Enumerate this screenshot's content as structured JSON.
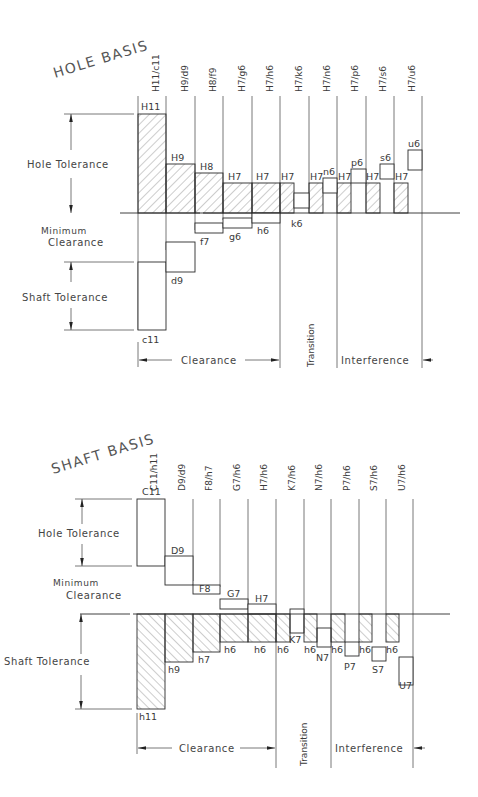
{
  "top": {
    "title": "HOLE BASIS",
    "fits": [
      "H11/c11",
      "H9/d9",
      "H8/f9",
      "H7/g6",
      "H7/h6",
      "H7/k6",
      "H7/n6",
      "H7/p6",
      "H7/s6",
      "H7/u6"
    ],
    "hole_labels": [
      "H11",
      "H9",
      "H8",
      "H7",
      "H7",
      "H7",
      "H7",
      "H7",
      "H7",
      "H7"
    ],
    "shaft_labels": [
      "c11",
      "d9",
      "f7",
      "g6",
      "h6",
      "k6",
      "n6",
      "p6",
      "s6",
      "u6"
    ],
    "side_labels": {
      "hole_tolerance": "Hole Tolerance",
      "minimum": "Minimum",
      "clearance": "Clearance",
      "shaft_tolerance": "Shaft Tolerance"
    },
    "zones": {
      "clearance": "Clearance",
      "transition": "Transition",
      "interference": "Interference"
    }
  },
  "bottom": {
    "title": "SHAFT BASIS",
    "fits": [
      "C11/h11",
      "D9/d9",
      "F8/h7",
      "G7/h6",
      "H7/h6",
      "K7/h6",
      "N7/h6",
      "P7/h6",
      "S7/h6",
      "U7/h6"
    ],
    "hole_labels": [
      "C11",
      "D9",
      "F8",
      "G7",
      "H7",
      "K7",
      "N7",
      "P7",
      "S7",
      "U7"
    ],
    "shaft_labels": [
      "h11",
      "h9",
      "h7",
      "h6",
      "h6",
      "h6",
      "h6",
      "h6",
      "h6",
      "h6"
    ],
    "side_labels": {
      "hole_tolerance": "Hole Tolerance",
      "minimum": "Minimum",
      "clearance": "Clearance",
      "shaft_tolerance": "Shaft Tolerance"
    },
    "zones": {
      "clearance": "Clearance",
      "transition": "Transition",
      "interference": "Interference"
    }
  }
}
